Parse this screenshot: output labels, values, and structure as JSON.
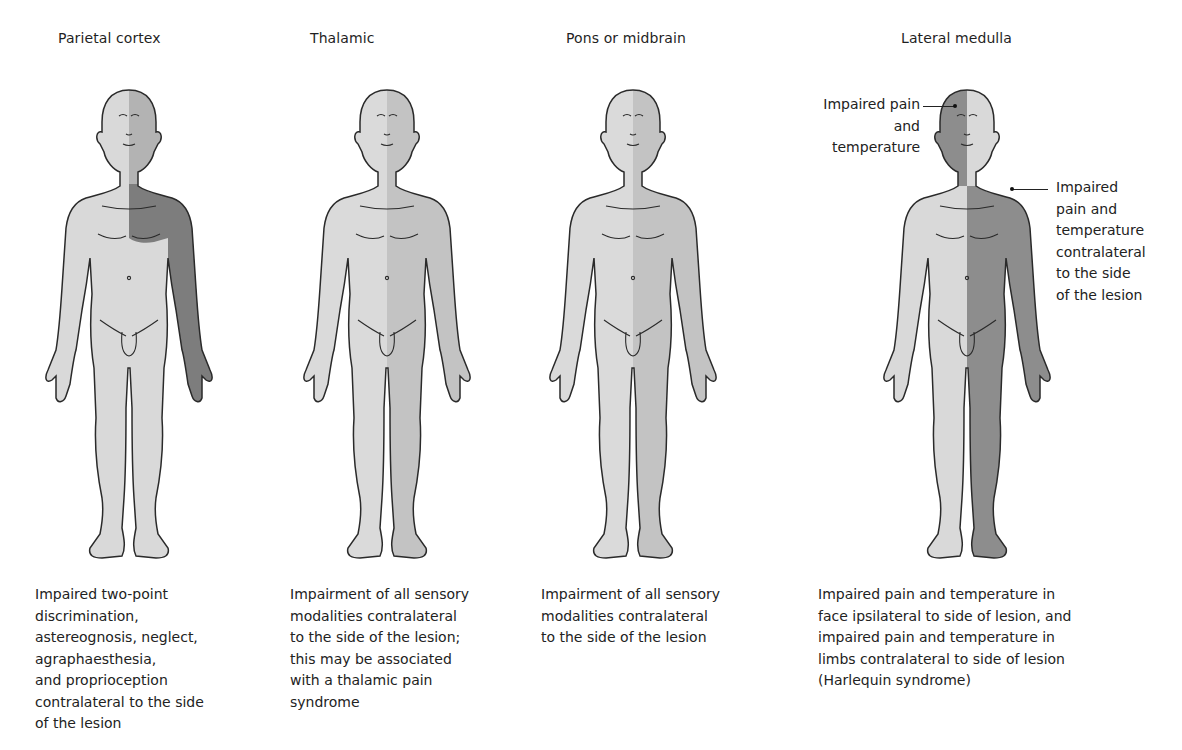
{
  "colors": {
    "unaffected": "#d9d9d9",
    "mild_affected": "#c2c2c2",
    "severe_affected": "#8a8a8a",
    "outline": "#2a2a2a"
  },
  "panels": [
    {
      "title": "Parietal cortex",
      "caption": "Impaired two-point\ndiscrimination,\nastereognosis, neglect,\nagraphaesthesia,\nand proprioception\ncontralateral to the side\nof the lesion",
      "shading": "right face light-dark, right upper chest and right arm dark"
    },
    {
      "title": "Thalamic",
      "caption": "Impairment of all sensory\nmodalities contralateral\nto the side of the lesion;\nthis may be associated\nwith a thalamic pain\nsyndrome",
      "shading": "entire right half medium grey"
    },
    {
      "title": "Pons or midbrain",
      "caption": "Impairment of all sensory\nmodalities contralateral\nto the side of the lesion",
      "shading": "entire right half medium grey"
    },
    {
      "title": "Lateral medulla",
      "caption": "Impaired pain and temperature in\nface ipsilateral to side of lesion, and\nimpaired pain and temperature in\nlimbs contralateral to side of lesion\n(Harlequin syndrome)",
      "shading": "left half of head dark, right half of body dark",
      "annotations": [
        {
          "label": "Impaired pain\nand temperature",
          "target": "face"
        },
        {
          "label": "Impaired\npain and\ntemperature\ncontralateral\nto the side\nof the lesion",
          "target": "body"
        }
      ]
    }
  ]
}
